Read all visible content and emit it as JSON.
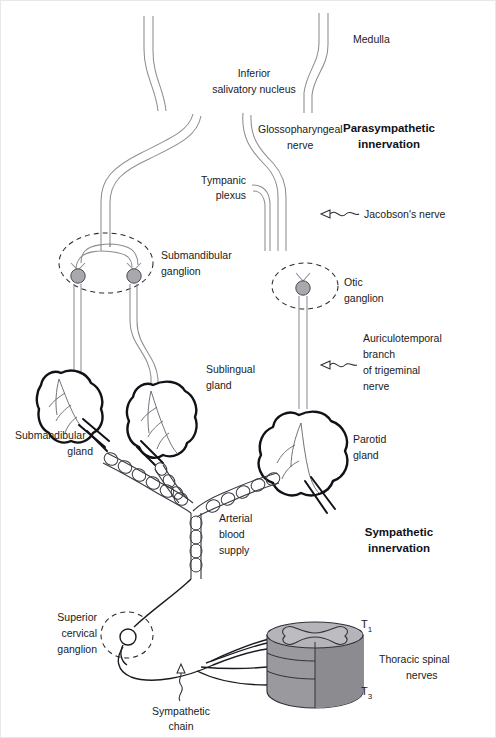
{
  "figure": {
    "background": "#ffffff",
    "nerve_stroke": "#8d8d93",
    "outline_stroke": "#111118",
    "ganglion_fill": "#a9a9ad",
    "cord_fill": "#9a9a9e"
  },
  "section_headings": {
    "parasympathetic_line1": "Parasympathetic",
    "parasympathetic_line2": "innervation",
    "sympathetic_line1": "Sympathetic",
    "sympathetic_line2": "innervation"
  },
  "labels": {
    "medulla": "Medulla",
    "inferior_salivatory_line1": "Inferior",
    "inferior_salivatory_line2": "salivatory nucleus",
    "glossopharyngeal_line1": "Glossopharyngeal",
    "glossopharyngeal_line2": "nerve",
    "tympanic_line1": "Tympanic",
    "tympanic_line2": "plexus",
    "jacobsons_nerve": "Jacobson's nerve",
    "submandibular_ganglion_line1": "Submandibular",
    "submandibular_ganglion_line2": "ganglion",
    "otic_ganglion_line1": "Otic",
    "otic_ganglion_line2": "ganglion",
    "auriculotemporal_line1": "Auriculotemporal",
    "auriculotemporal_line2": "branch",
    "auriculotemporal_line3": "of trigeminal",
    "auriculotemporal_line4": "nerve",
    "sublingual_gland_line1": "Sublingual",
    "sublingual_gland_line2": "gland",
    "submandibular_gland_line1": "Submandibular",
    "submandibular_gland_line2": "gland",
    "parotid_gland_line1": "Parotid",
    "parotid_gland_line2": "gland",
    "arterial_supply_line1": "Arterial",
    "arterial_supply_line2": "blood",
    "arterial_supply_line3": "supply",
    "superior_cervical_line1": "Superior",
    "superior_cervical_line2": "cervical",
    "superior_cervical_line3": "ganglion",
    "sympathetic_chain_line1": "Sympathetic",
    "sympathetic_chain_line2": "chain",
    "thoracic_nerves_line1": "Thoracic spinal",
    "thoracic_nerves_line2": "nerves",
    "spinal_level_top": "T",
    "spinal_level_top_sub": "1",
    "spinal_level_bottom": "T",
    "spinal_level_bottom_sub": "3"
  },
  "structures": {
    "glands": [
      {
        "name": "submandibular-gland",
        "side": "left"
      },
      {
        "name": "sublingual-gland",
        "side": "center-left"
      },
      {
        "name": "parotid-gland",
        "side": "right"
      }
    ],
    "ganglia": [
      {
        "name": "submandibular-ganglion",
        "style": "filled-pair"
      },
      {
        "name": "otic-ganglion",
        "style": "filled-single"
      },
      {
        "name": "superior-cervical-ganglion",
        "style": "open-single"
      }
    ],
    "spinal_cord": {
      "name": "thoracic-spinal-cord",
      "segments": 3,
      "nerve_roots": 3
    }
  }
}
